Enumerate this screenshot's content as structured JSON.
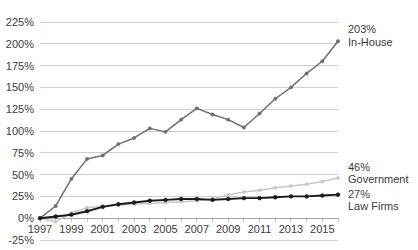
{
  "chart_data": {
    "type": "line",
    "title": "",
    "subtitle": "",
    "xlabel": "",
    "ylabel": "",
    "grid": true,
    "legend_position": "right-inline-annotations",
    "xlim": [
      1997,
      2016
    ],
    "ylim": [
      -25,
      225
    ],
    "ytick_labels": [
      "225%",
      "200%",
      "175%",
      "150%",
      "125%",
      "100%",
      "75%",
      "50%",
      "25%",
      "0%",
      "-25%"
    ],
    "ytick_values": [
      225,
      200,
      175,
      150,
      125,
      100,
      75,
      50,
      25,
      0,
      -25
    ],
    "xtick_labels": [
      "1997",
      "1999",
      "2001",
      "2003",
      "2005",
      "2007",
      "2009",
      "2011",
      "2013",
      "2015"
    ],
    "xtick_values": [
      1997,
      1999,
      2001,
      2003,
      2005,
      2007,
      2009,
      2011,
      2013,
      2015
    ],
    "x": [
      1997,
      1998,
      1999,
      2000,
      2001,
      2002,
      2003,
      2004,
      2005,
      2006,
      2007,
      2008,
      2009,
      2010,
      2011,
      2012,
      2013,
      2014,
      2015,
      2016
    ],
    "series": [
      {
        "name": "In-House",
        "color": "#6f6f6f",
        "end_value_label": "203%",
        "end_label": "In-House",
        "values": [
          0,
          14,
          45,
          68,
          72,
          85,
          92,
          103,
          99,
          113,
          126,
          119,
          113,
          104,
          120,
          137,
          150,
          166,
          180,
          203
        ]
      },
      {
        "name": "Government",
        "color": "#c8c8c8",
        "end_value_label": "46%",
        "end_label": "Government",
        "values": [
          0,
          -4,
          6,
          12,
          14,
          15,
          16,
          17,
          18,
          19,
          20,
          22,
          27,
          30,
          32,
          35,
          37,
          39,
          42,
          46
        ]
      },
      {
        "name": "Law Firms",
        "color": "#1a1a1a",
        "end_value_label": "27%",
        "end_label": "Law Firms",
        "values": [
          0,
          2,
          4,
          8,
          13,
          16,
          18,
          20,
          21,
          22,
          22,
          21,
          22,
          23,
          23,
          24,
          25,
          25,
          26,
          27
        ]
      }
    ],
    "annotations": [
      {
        "value": "203%",
        "label": "In-House"
      },
      {
        "value": "46%",
        "label": "Government"
      },
      {
        "value": "27%",
        "label": "Law Firms"
      }
    ]
  }
}
